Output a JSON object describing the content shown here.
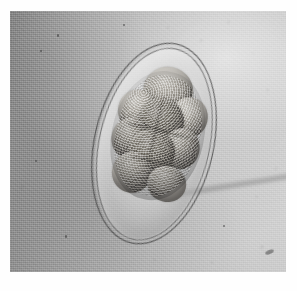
{
  "image": {
    "kind": "light-microscopy-photomicrograph",
    "subject": "parasite egg (helminth ovum) containing multicellular morula-stage embryo",
    "modality": "brightfield light microscopy",
    "color_mode": "grayscale",
    "caption": "",
    "overlay_text": "",
    "dimensions": {
      "width_px": 297,
      "height_px": 291
    },
    "photo_area": {
      "left_px": 10,
      "top_px": 11,
      "width_px": 276,
      "height_px": 261
    },
    "border_color": "#fefefe"
  },
  "background": {
    "name": "mounting-medium-field",
    "description": "mottled gray illumination field, darker at left, brighter toward upper right",
    "dark_tone": "#8d8d8d",
    "mid_tone": "#b4b4b4",
    "light_tone": "#d3d3d3",
    "grain": "fine photographic emulsion grain"
  },
  "ovum": {
    "name": "egg",
    "shape": "ellipse",
    "tilt_degrees": 13,
    "center_px": {
      "x": 144,
      "y": 133
    },
    "major_axis_px": 205,
    "minor_axis_px": 120,
    "shell": {
      "name": "eggshell",
      "description": "double-contoured smooth shell, two thin dark refractile lines",
      "line_count": 2,
      "outer_line_color": "#3a3a3a",
      "inner_line_color": "#484848"
    },
    "cavity": {
      "name": "perivitelline-space",
      "description": "clear pale space between shell and embryo",
      "tone": "#e3e3e3"
    }
  },
  "embryo": {
    "name": "morula",
    "stage": "morula / multicellular cleavage stage",
    "description": "granular mass of rounded blastomeres filling the upper-central portion of the egg",
    "blastomere_count": 9,
    "texture": "coarsely granular",
    "tone_light": "#cfcdc8",
    "tone_mid": "#a5a29c",
    "tone_dark": "#6e6b66",
    "blastomeres": [
      {
        "id": "cell-1",
        "position": "upper-center",
        "tone": "light",
        "cx_pct": 50,
        "cy_pct": 13,
        "rx_pct": 30,
        "ry_pct": 20
      },
      {
        "id": "cell-2",
        "position": "upper-left",
        "tone": "light",
        "cx_pct": 20,
        "cy_pct": 33,
        "rx_pct": 23,
        "ry_pct": 17
      },
      {
        "id": "cell-3",
        "position": "upper-right",
        "tone": "light",
        "cx_pct": 81,
        "cy_pct": 30,
        "rx_pct": 23,
        "ry_pct": 17
      },
      {
        "id": "cell-4",
        "position": "mid-center",
        "tone": "dark",
        "cx_pct": 50,
        "cy_pct": 38,
        "rx_pct": 27,
        "ry_pct": 19
      },
      {
        "id": "cell-5",
        "position": "mid-left",
        "tone": "normal",
        "cx_pct": 18,
        "cy_pct": 57,
        "rx_pct": 22,
        "ry_pct": 17
      },
      {
        "id": "cell-6",
        "position": "mid-right",
        "tone": "normal",
        "cx_pct": 80,
        "cy_pct": 56,
        "rx_pct": 22,
        "ry_pct": 17
      },
      {
        "id": "cell-7",
        "position": "lower-center",
        "tone": "dark",
        "cx_pct": 47,
        "cy_pct": 64,
        "rx_pct": 28,
        "ry_pct": 19
      },
      {
        "id": "cell-8",
        "position": "lower-left",
        "tone": "normal",
        "cx_pct": 30,
        "cy_pct": 84,
        "rx_pct": 24,
        "ry_pct": 17
      },
      {
        "id": "cell-9",
        "position": "bottom-right",
        "tone": "normal",
        "cx_pct": 73,
        "cy_pct": 87,
        "rx_pct": 23,
        "ry_pct": 15
      }
    ]
  },
  "artifacts": {
    "scratch": {
      "name": "diagonal-streak-artifact",
      "description": "faint dark diagonal streak on the lower right of the field",
      "angle_degrees": -9
    },
    "debris_specks": [
      {
        "x_pct": 17,
        "y_pct": 9,
        "size_px": 2.2,
        "kind": "dark"
      },
      {
        "x_pct": 11,
        "y_pct": 15,
        "size_px": 1.6,
        "kind": "dark"
      },
      {
        "x_pct": 6,
        "y_pct": 36,
        "size_px": 1.5,
        "kind": "soft"
      },
      {
        "x_pct": 9,
        "y_pct": 57,
        "size_px": 2.0,
        "kind": "dark"
      },
      {
        "x_pct": 4,
        "y_pct": 67,
        "size_px": 1.7,
        "kind": "soft"
      },
      {
        "x_pct": 14,
        "y_pct": 72,
        "size_px": 1.4,
        "kind": "soft"
      },
      {
        "x_pct": 20,
        "y_pct": 86,
        "size_px": 2.1,
        "kind": "dark"
      },
      {
        "x_pct": 26,
        "y_pct": 93,
        "size_px": 1.5,
        "kind": "soft"
      },
      {
        "x_pct": 31,
        "y_pct": 64,
        "size_px": 1.8,
        "kind": "soft"
      },
      {
        "x_pct": 36,
        "y_pct": 78,
        "size_px": 1.5,
        "kind": "soft"
      },
      {
        "x_pct": 43,
        "y_pct": 88,
        "size_px": 1.4,
        "kind": "soft"
      },
      {
        "x_pct": 52,
        "y_pct": 95,
        "size_px": 1.6,
        "kind": "soft"
      },
      {
        "x_pct": 41,
        "y_pct": 5,
        "size_px": 2.0,
        "kind": "dark"
      },
      {
        "x_pct": 57,
        "y_pct": 6,
        "size_px": 1.5,
        "kind": "soft"
      },
      {
        "x_pct": 69,
        "y_pct": 11,
        "size_px": 1.7,
        "kind": "soft"
      },
      {
        "x_pct": 79,
        "y_pct": 4,
        "size_px": 1.4,
        "kind": "soft"
      },
      {
        "x_pct": 88,
        "y_pct": 16,
        "size_px": 1.6,
        "kind": "soft"
      },
      {
        "x_pct": 93,
        "y_pct": 30,
        "size_px": 1.5,
        "kind": "soft"
      },
      {
        "x_pct": 85,
        "y_pct": 37,
        "size_px": 1.3,
        "kind": "soft"
      },
      {
        "x_pct": 91,
        "y_pct": 90,
        "size_px": 1.8,
        "kind": "soft"
      },
      {
        "x_pct": 77,
        "y_pct": 82,
        "size_px": 2.2,
        "kind": "dark"
      },
      {
        "x_pct": 68,
        "y_pct": 90,
        "size_px": 1.5,
        "kind": "soft"
      },
      {
        "x_pct": 96,
        "y_pct": 60,
        "size_px": 1.6,
        "kind": "soft"
      },
      {
        "x_pct": 89,
        "y_pct": 71,
        "size_px": 1.4,
        "kind": "soft"
      },
      {
        "x_pct": 73,
        "y_pct": 96,
        "size_px": 1.5,
        "kind": "soft"
      }
    ],
    "large_debris": {
      "name": "debris-particle",
      "x_pct": 92.5,
      "y_pct": 91.5,
      "width_px": 9,
      "height_px": 4,
      "angle_degrees": -22
    }
  }
}
